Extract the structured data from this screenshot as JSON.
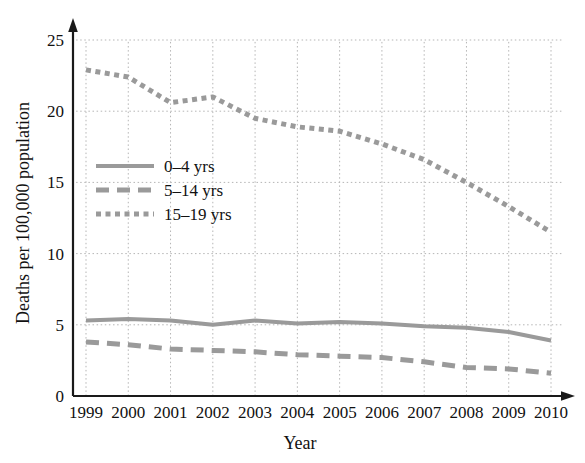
{
  "chart_data": {
    "type": "line",
    "title": "",
    "xlabel": "Year",
    "ylabel": "Deaths per 100,000 population",
    "categories": [
      1999,
      2000,
      2001,
      2002,
      2003,
      2004,
      2005,
      2006,
      2007,
      2008,
      2009,
      2010
    ],
    "x": [
      "1999",
      "2000",
      "2001",
      "2002",
      "2003",
      "2004",
      "2005",
      "2006",
      "2007",
      "2008",
      "2009",
      "2010"
    ],
    "xlim": [
      1999,
      2010
    ],
    "ylim": [
      0,
      25
    ],
    "yticks": [
      "0",
      "5",
      "10",
      "15",
      "20",
      "25"
    ],
    "ytick_values": [
      0,
      5,
      10,
      15,
      20,
      25
    ],
    "grid": true,
    "grid_style": "dotted",
    "legend_position": "left-middle",
    "series": [
      {
        "name": "0–4 yrs",
        "style": "solid",
        "color": "#9a9a9a",
        "values": [
          5.3,
          5.4,
          5.3,
          5.0,
          5.3,
          5.1,
          5.2,
          5.1,
          4.9,
          4.8,
          4.5,
          3.9
        ]
      },
      {
        "name": "5–14 yrs",
        "style": "dashed",
        "color": "#9a9a9a",
        "values": [
          3.8,
          3.6,
          3.3,
          3.2,
          3.1,
          2.9,
          2.8,
          2.7,
          2.4,
          2.0,
          1.9,
          1.6
        ]
      },
      {
        "name": "15–19 yrs",
        "style": "dotted",
        "color": "#9a9a9a",
        "values": [
          22.9,
          22.4,
          20.6,
          21.0,
          19.5,
          18.9,
          18.6,
          17.7,
          16.6,
          15.0,
          13.3,
          11.5
        ]
      }
    ]
  },
  "axes": {
    "y_title": "Deaths per 100,000 population",
    "x_title": "Year",
    "y_tick_labels": [
      "0",
      "5",
      "10",
      "15",
      "20",
      "25"
    ],
    "x_tick_labels": [
      "1999",
      "2000",
      "2001",
      "2002",
      "2003",
      "2004",
      "2005",
      "2006",
      "2007",
      "2008",
      "2009",
      "2010"
    ]
  },
  "legend": {
    "entries": [
      {
        "label": "0–4 yrs",
        "style": "solid"
      },
      {
        "label": "5–14 yrs",
        "style": "dashed"
      },
      {
        "label": "15–19 yrs",
        "style": "dotted"
      }
    ]
  },
  "colors": {
    "line": "#9a9a9a",
    "axis": "#1a1a1a",
    "grid": "#b5b5b5",
    "text": "#111111",
    "background": "#ffffff"
  }
}
